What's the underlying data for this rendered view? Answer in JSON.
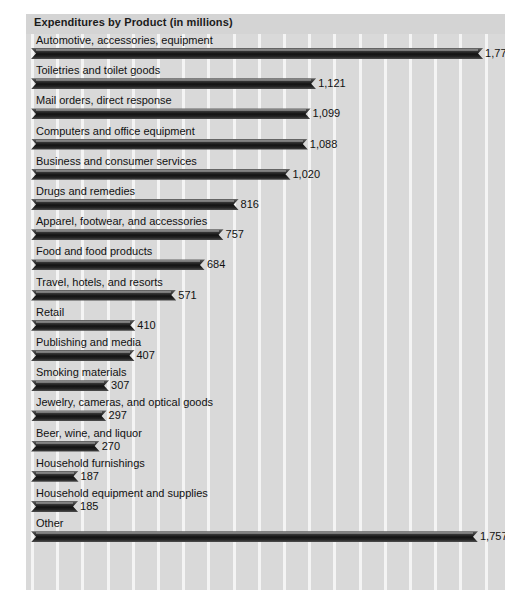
{
  "chart_data": {
    "type": "bar",
    "orientation": "horizontal",
    "title": "Expenditures by Product (in millions)",
    "xlabel": "",
    "ylabel": "",
    "xlim": [
      0,
      1900
    ],
    "grid": "vertical-white-lines",
    "legend": "none",
    "units": "millions of dollars",
    "categories": [
      "Automotive, accessories, equipment",
      "Toiletries and toilet goods",
      "Mail orders, direct response",
      "Computers and office equipment",
      "Business and consumer services",
      "Drugs and remedies",
      "Apparel, footwear, and accessories",
      "Food and food products",
      "Travel, hotels, and resorts",
      "Retail",
      "Publishing and media",
      "Smoking materials",
      "Jewelry, cameras, and optical goods",
      "Beer, wine, and liquor",
      "Household furnishings",
      "Household equipment and supplies",
      "Other"
    ],
    "values": [
      1777,
      1121,
      1099,
      1088,
      1020,
      816,
      757,
      684,
      571,
      410,
      407,
      307,
      297,
      270,
      187,
      185,
      1757
    ],
    "value_labels": [
      "1,777",
      "1,121",
      "1,099",
      "1,088",
      "1,020",
      "816",
      "757",
      "684",
      "571",
      "410",
      "407",
      "307",
      "297",
      "270",
      "187",
      "185",
      "1,757"
    ]
  },
  "colors": {
    "panel_background": "#d9d9d9",
    "title_band": "#d4d4d4",
    "gridline": "#f4f4f4",
    "bar_dark": "#121212",
    "bar_highlight": "#6e6e6e",
    "text": "#111111"
  }
}
